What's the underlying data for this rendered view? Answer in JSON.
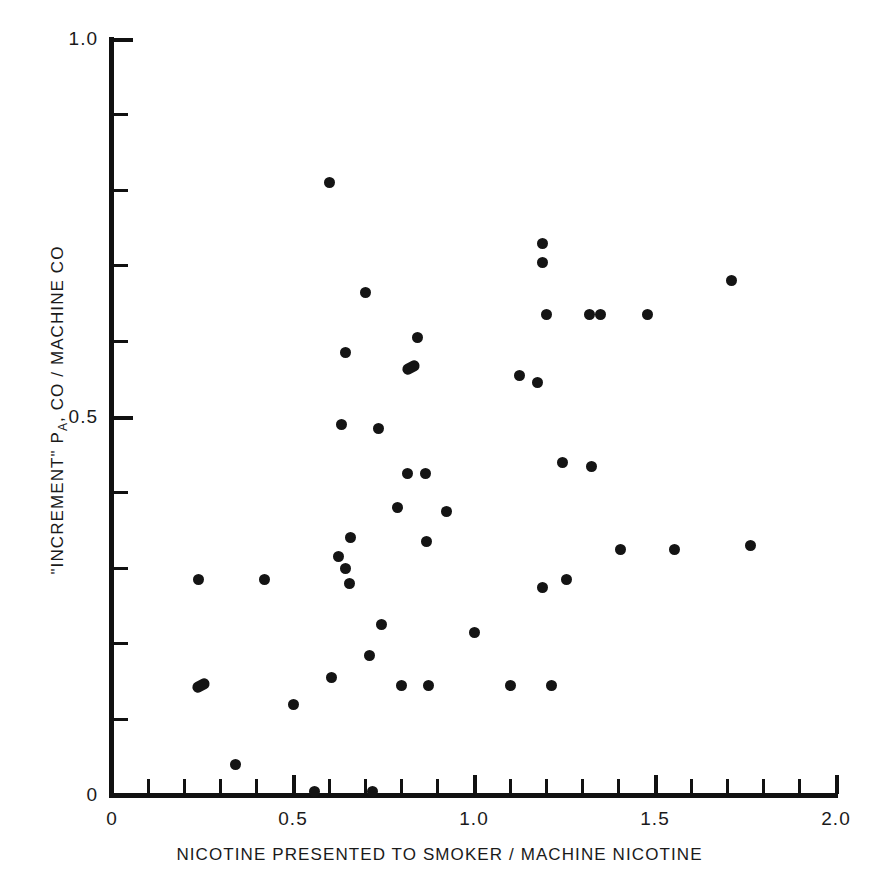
{
  "chart_data": {
    "type": "scatter",
    "title": "",
    "xlabel": "NICOTINE PRESENTED TO SMOKER / MACHINE NICOTINE",
    "ylabel": "\"INCREMENT\" P_A, CO / MACHINE CO",
    "ylabel_parts": {
      "prefix": "\"INCREMENT\" P",
      "subscript": "A",
      "suffix": ", CO / MACHINE CO"
    },
    "xlim": [
      0,
      2.0
    ],
    "ylim": [
      0,
      1.0
    ],
    "xticks": [
      0,
      0.5,
      1.0,
      1.5,
      2.0
    ],
    "xtick_labels": [
      "0",
      "0.5",
      "1.0",
      "1.5",
      "2.0"
    ],
    "yticks": [
      0,
      0.5,
      1.0
    ],
    "ytick_labels": [
      "0",
      "0.5",
      "1.0"
    ],
    "x_minor_tick_step": 0.1,
    "y_minor_tick_step": 0.1,
    "grid": false,
    "legend": null,
    "marker": "filled-circle",
    "marker_color": "#141414",
    "axis_color": "#111111",
    "background_color": "#ffffff",
    "n_points": 49,
    "points": [
      {
        "x": 0.6,
        "y": 0.81
      },
      {
        "x": 1.19,
        "y": 0.73
      },
      {
        "x": 1.19,
        "y": 0.705
      },
      {
        "x": 1.71,
        "y": 0.68
      },
      {
        "x": 0.7,
        "y": 0.665
      },
      {
        "x": 1.2,
        "y": 0.635
      },
      {
        "x": 1.32,
        "y": 0.635
      },
      {
        "x": 1.35,
        "y": 0.635
      },
      {
        "x": 1.48,
        "y": 0.635
      },
      {
        "x": 0.845,
        "y": 0.605
      },
      {
        "x": 0.645,
        "y": 0.585
      },
      {
        "x": 0.825,
        "y": 0.565,
        "wide": true
      },
      {
        "x": 1.125,
        "y": 0.555
      },
      {
        "x": 1.175,
        "y": 0.545
      },
      {
        "x": 0.635,
        "y": 0.49
      },
      {
        "x": 0.735,
        "y": 0.485
      },
      {
        "x": 1.245,
        "y": 0.44
      },
      {
        "x": 1.325,
        "y": 0.435
      },
      {
        "x": 0.815,
        "y": 0.425
      },
      {
        "x": 0.865,
        "y": 0.425
      },
      {
        "x": 0.79,
        "y": 0.38
      },
      {
        "x": 0.925,
        "y": 0.375
      },
      {
        "x": 0.66,
        "y": 0.34
      },
      {
        "x": 0.87,
        "y": 0.335
      },
      {
        "x": 1.405,
        "y": 0.325
      },
      {
        "x": 1.555,
        "y": 0.325
      },
      {
        "x": 1.765,
        "y": 0.33
      },
      {
        "x": 0.625,
        "y": 0.315
      },
      {
        "x": 0.645,
        "y": 0.3
      },
      {
        "x": 0.24,
        "y": 0.285
      },
      {
        "x": 0.42,
        "y": 0.285
      },
      {
        "x": 0.655,
        "y": 0.28
      },
      {
        "x": 1.19,
        "y": 0.275
      },
      {
        "x": 1.255,
        "y": 0.285
      },
      {
        "x": 0.745,
        "y": 0.225
      },
      {
        "x": 1.0,
        "y": 0.215
      },
      {
        "x": 0.71,
        "y": 0.185
      },
      {
        "x": 0.605,
        "y": 0.155
      },
      {
        "x": 0.245,
        "y": 0.145,
        "wide": true
      },
      {
        "x": 0.8,
        "y": 0.145
      },
      {
        "x": 0.875,
        "y": 0.145
      },
      {
        "x": 1.1,
        "y": 0.145
      },
      {
        "x": 1.215,
        "y": 0.145
      },
      {
        "x": 0.5,
        "y": 0.12
      },
      {
        "x": 0.34,
        "y": 0.04
      },
      {
        "x": 0.56,
        "y": 0.005
      },
      {
        "x": 0.72,
        "y": 0.005
      }
    ]
  },
  "axes": {
    "x_title": "NICOTINE PRESENTED TO SMOKER / MACHINE NICOTINE",
    "y_title_prefix": "\"INCREMENT\" P",
    "y_title_sub": "A",
    "y_title_suffix": ", CO / MACHINE CO",
    "x_labels": [
      "0",
      "0.5",
      "1.0",
      "1.5",
      "2.0"
    ],
    "y_labels": [
      "1.0",
      "0.5",
      "0"
    ]
  }
}
